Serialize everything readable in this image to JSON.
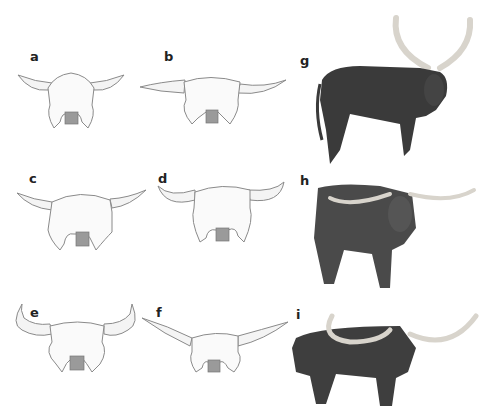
{
  "figure": {
    "panels": [
      {
        "id": "a",
        "label": "a",
        "kind": "skull-drawing",
        "description": "Skull with short upturned horns"
      },
      {
        "id": "b",
        "label": "b",
        "kind": "skull-drawing",
        "description": "Skull with long lateral horns"
      },
      {
        "id": "c",
        "label": "c",
        "kind": "skull-drawing",
        "description": "Skull with medium upturned horns"
      },
      {
        "id": "d",
        "label": "d",
        "kind": "skull-drawing",
        "description": "Skull with curved lyre horns"
      },
      {
        "id": "e",
        "label": "e",
        "kind": "skull-drawing",
        "description": "Skull with tall upswept horns"
      },
      {
        "id": "f",
        "label": "f",
        "kind": "skull-drawing",
        "description": "Skull with very long spreading horns"
      },
      {
        "id": "g",
        "label": "g",
        "kind": "photo",
        "description": "Dark cow with very tall curved horns"
      },
      {
        "id": "h",
        "label": "h",
        "kind": "photo",
        "description": "Mottled longhorn steer with wide horns"
      },
      {
        "id": "i",
        "label": "i",
        "kind": "photo",
        "description": "Longhorn bull with overlaid long horn spread"
      }
    ],
    "colors": {
      "line": "#8a8a8a",
      "horn_fill": "#f4f4f4",
      "nose_fill": "#9a9a9a",
      "animal_dark": "#3a3a3a",
      "horn_photo": "#d8d4cc"
    }
  }
}
